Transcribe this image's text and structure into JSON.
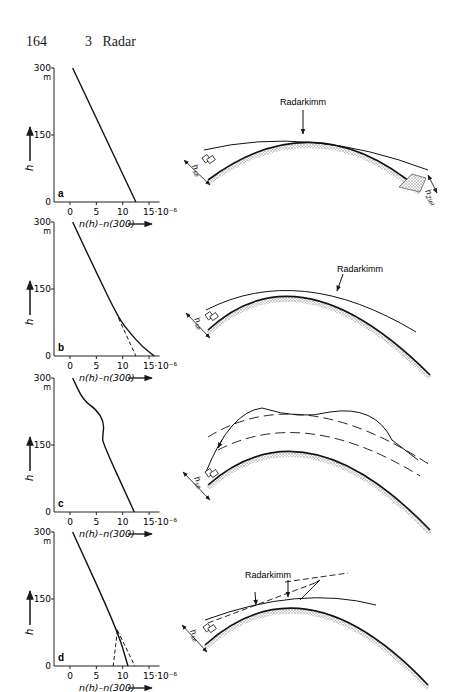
{
  "header": {
    "page_number": "164",
    "chapter_number": "3",
    "chapter_title": "Radar"
  },
  "axes_common": {
    "y_label": "h",
    "y_ticks": [
      "0",
      "150",
      "300"
    ],
    "y_unit": "m",
    "x_ticks": [
      "0",
      "5",
      "10",
      "15·10⁻⁶"
    ],
    "x_label": "n(h)–n(300)"
  },
  "chart_data": [
    {
      "type": "line",
      "panel": "a",
      "xlabel": "n(h)-n(300)",
      "ylabel": "h [m]",
      "xlim": [
        -3,
        17
      ],
      "ylim": [
        0,
        300
      ],
      "series": [
        {
          "name": "profile",
          "style": "solid",
          "points": [
            [
              0.5,
              300
            ],
            [
              12.5,
              0
            ]
          ]
        }
      ]
    },
    {
      "type": "line",
      "panel": "b",
      "xlabel": "n(h)-n(300)",
      "ylabel": "h [m]",
      "xlim": [
        -3,
        17
      ],
      "ylim": [
        0,
        300
      ],
      "series": [
        {
          "name": "profile",
          "style": "solid",
          "points": [
            [
              0.5,
              300
            ],
            [
              5,
              187
            ],
            [
              9.2,
              85
            ],
            [
              11.5,
              50
            ],
            [
              13.8,
              20
            ],
            [
              16,
              0
            ]
          ]
        },
        {
          "name": "standard",
          "style": "dashed",
          "points": [
            [
              9.2,
              85
            ],
            [
              12.5,
              0
            ]
          ]
        }
      ]
    },
    {
      "type": "line",
      "panel": "c",
      "xlabel": "n(h)-n(300)",
      "ylabel": "h [m]",
      "xlim": [
        -3,
        17
      ],
      "ylim": [
        0,
        300
      ],
      "series": [
        {
          "name": "profile",
          "style": "solid",
          "points": [
            [
              0.5,
              300
            ],
            [
              2.5,
              250
            ],
            [
              5,
              230
            ],
            [
              6.5,
              200
            ],
            [
              6.2,
              170
            ],
            [
              6.2,
              155
            ],
            [
              12.2,
              0
            ]
          ]
        }
      ]
    },
    {
      "type": "line",
      "panel": "d",
      "xlabel": "n(h)-n(300)",
      "ylabel": "h [m]",
      "xlim": [
        -3,
        17
      ],
      "ylim": [
        0,
        300
      ],
      "series": [
        {
          "name": "profile",
          "style": "solid",
          "points": [
            [
              0.5,
              300
            ],
            [
              9,
              80
            ],
            [
              11,
              0
            ]
          ]
        },
        {
          "name": "variant-1",
          "style": "dashed",
          "points": [
            [
              9,
              80
            ],
            [
              8.2,
              0
            ]
          ]
        },
        {
          "name": "variant-2",
          "style": "dashed",
          "points": [
            [
              9,
              80
            ],
            [
              12.3,
              0
            ]
          ]
        }
      ]
    }
  ],
  "diagrams": [
    {
      "panel": "a",
      "label": "Radarkimm",
      "transmitter_label": "h_se",
      "target_label": "h_Ziel",
      "description": "standard refraction, ray to target beyond horizon"
    },
    {
      "panel": "b",
      "label": "Radarkimm",
      "transmitter_label": "h_se",
      "description": "super-refraction, ray bent toward earth"
    },
    {
      "panel": "c",
      "label": "",
      "transmitter_label": "h_se",
      "description": "elevated duct between dashed layers"
    },
    {
      "panel": "d",
      "label": "Radarkimm",
      "transmitter_label": "h_se",
      "description": "surface duct, two horizon arrows"
    }
  ]
}
